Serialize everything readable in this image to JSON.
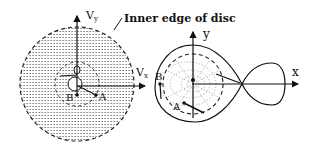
{
  "annotation": {
    "text": "Inner edge of disc"
  },
  "left_panel": {
    "axis_y_label": "V",
    "axis_y_sub": "y",
    "axis_x_label": "V",
    "axis_x_sub": "x",
    "point_a": "A",
    "point_b": "B"
  },
  "right_panel": {
    "axis_y_label": "y",
    "axis_x_label": "x",
    "point_a": "A",
    "point_b": "B"
  },
  "colors": {
    "ink": "#111111",
    "hatch": "#888888",
    "background": "#ffffff"
  }
}
